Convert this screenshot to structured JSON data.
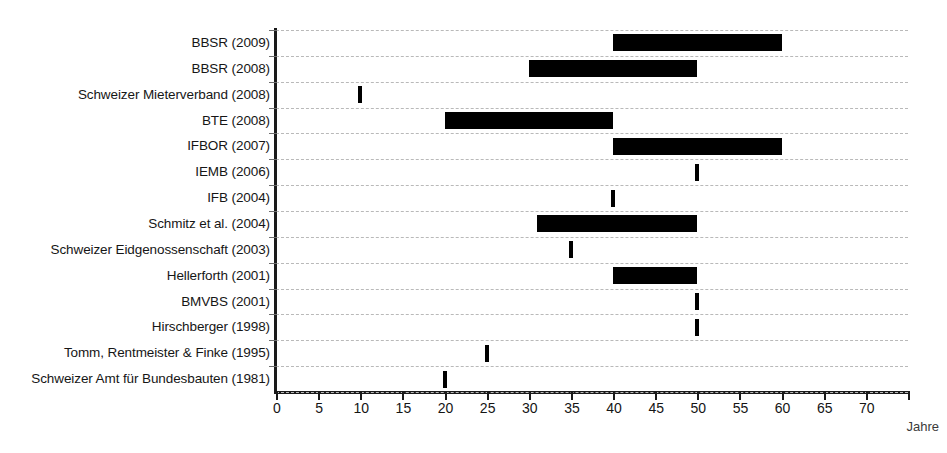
{
  "chart_data": {
    "type": "bar",
    "title": "",
    "subtitle": "",
    "xlabel": "Jahre",
    "ylabel": "",
    "xlim": [
      0,
      75
    ],
    "ylim": null,
    "grid": "horizontal-dashed",
    "legend": null,
    "orientation": "horizontal",
    "note": "Horizontal range (span) chart: each category shows a span of years; single values are drawn as thin tick marks.",
    "xticks": [
      0,
      5,
      10,
      15,
      20,
      25,
      30,
      35,
      40,
      45,
      50,
      55,
      60,
      65,
      70
    ],
    "categories": [
      "BBSR (2009)",
      "BBSR (2008)",
      "Schweizer Mieterverband (2008)",
      "BTE (2008)",
      "IFBOR (2007)",
      "IEMB (2006)",
      "IFB (2004)",
      "Schmitz et al. (2004)",
      "Schweizer Eidgenossenschaft (2003)",
      "Hellerforth (2001)",
      "BMVBS (2001)",
      "Hirschberger (1998)",
      "Tomm, Rentmeister & Finke (1995)",
      "Schweizer Amt für Bundesbauten (1981)"
    ],
    "spans": [
      {
        "label": "BBSR (2009)",
        "start": 40,
        "end": 60,
        "single": false
      },
      {
        "label": "BBSR (2008)",
        "start": 30,
        "end": 50,
        "single": false
      },
      {
        "label": "Schweizer Mieterverband (2008)",
        "start": 10,
        "end": 10,
        "single": true
      },
      {
        "label": "BTE (2008)",
        "start": 20,
        "end": 40,
        "single": false
      },
      {
        "label": "IFBOR (2007)",
        "start": 40,
        "end": 60,
        "single": false
      },
      {
        "label": "IEMB (2006)",
        "start": 50,
        "end": 50,
        "single": true
      },
      {
        "label": "IFB (2004)",
        "start": 40,
        "end": 40,
        "single": true
      },
      {
        "label": "Schmitz et al. (2004)",
        "start": 31,
        "end": 50,
        "single": false
      },
      {
        "label": "Schweizer Eidgenossenschaft (2003)",
        "start": 35,
        "end": 35,
        "single": true
      },
      {
        "label": "Hellerforth (2001)",
        "start": 40,
        "end": 50,
        "single": false
      },
      {
        "label": "BMVBS (2001)",
        "start": 50,
        "end": 50,
        "single": true
      },
      {
        "label": "Hirschberger (1998)",
        "start": 50,
        "end": 50,
        "single": true
      },
      {
        "label": "Tomm, Rentmeister & Finke (1995)",
        "start": 25,
        "end": 25,
        "single": true
      },
      {
        "label": "Schweizer Amt für Bundesbauten (1981)",
        "start": 20,
        "end": 20,
        "single": true
      }
    ],
    "colors": {
      "bar": "#000000",
      "gridline": "#b9b9b9",
      "axis": "#1a1a1a",
      "text": "#161616"
    }
  }
}
